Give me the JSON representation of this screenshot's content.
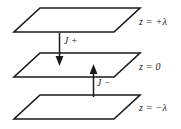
{
  "figure": {
    "background_color": "#ffffff",
    "line_color": "#1a1a1a"
  },
  "planes": [
    {
      "id": "top",
      "label": "z = +λ",
      "label_x": 139,
      "label_y": 17
    },
    {
      "id": "middle",
      "label": "z = 0",
      "label_x": 139,
      "label_y": 62
    },
    {
      "id": "bottom",
      "label": "z = −λ",
      "label_x": 139,
      "label_y": 103
    }
  ],
  "arrows": [
    {
      "id": "j-plus",
      "label": "J +",
      "direction": "down",
      "label_x": 64,
      "label_y": 37
    },
    {
      "id": "j-minus",
      "label": "J −",
      "direction": "up",
      "label_x": 97,
      "label_y": 79
    }
  ]
}
